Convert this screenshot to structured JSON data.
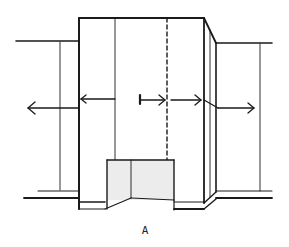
{
  "figure": {
    "label": "A",
    "colors": {
      "stroke": "#1a1a1a",
      "fill_opening": "#ececec",
      "background": "#ffffff"
    }
  },
  "elements": {
    "left_wall": "left-side-wall",
    "main_block": "central-projecting-block",
    "right_wall": "right-side-wall",
    "opening": "ground-level-opening",
    "dashed_axis": "dashed-center-axis",
    "arrows": [
      {
        "name": "arrow-left-outward",
        "direction": "left"
      },
      {
        "name": "arrow-into-left-edge",
        "direction": "left"
      },
      {
        "name": "arrow-from-marker-right",
        "direction": "right"
      },
      {
        "name": "arrow-to-right-edge",
        "direction": "right"
      },
      {
        "name": "arrow-right-outward",
        "direction": "right"
      }
    ]
  }
}
